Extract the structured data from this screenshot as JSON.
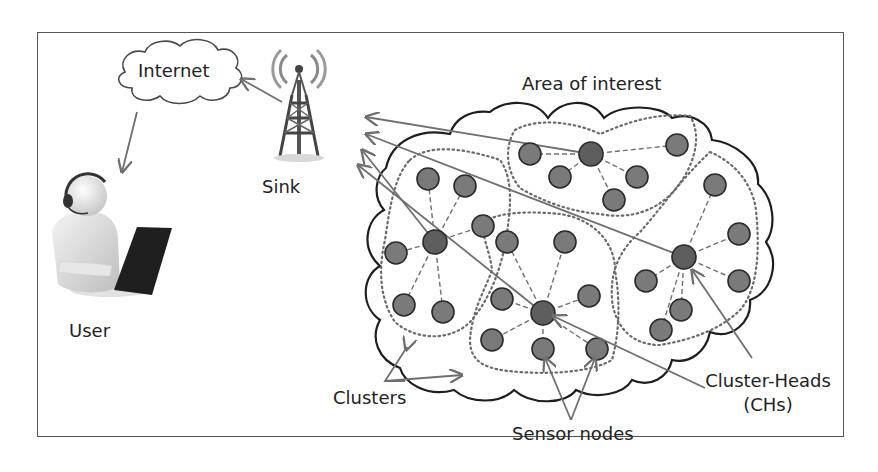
{
  "diagram": {
    "labels": {
      "internet": "Internet",
      "sink": "Sink",
      "user": "User",
      "area": "Area of interest",
      "clusters": "Clusters",
      "sensor_nodes": "Sensor nodes",
      "cluster_heads_line1": "Cluster-Heads",
      "cluster_heads_line2": "(CHs)"
    },
    "colors": {
      "node_fill": "#7a7a7a",
      "ch_fill": "#5e5e5e",
      "node_stroke": "#2a2a2a",
      "arrow": "#6f6f6f",
      "cloud_stroke": "#1e1e1e",
      "cluster_dotted": "#6a6a6a"
    },
    "clusters": [
      {
        "name": "cluster-left",
        "head": [
          435,
          242
        ],
        "members": [
          [
            428,
            179
          ],
          [
            465,
            186
          ],
          [
            483,
            226
          ],
          [
            396,
            253
          ],
          [
            404,
            305
          ],
          [
            443,
            312
          ]
        ]
      },
      {
        "name": "cluster-top",
        "head": [
          591,
          154
        ],
        "members": [
          [
            530,
            154
          ],
          [
            560,
            177
          ],
          [
            637,
            177
          ],
          [
            614,
            200
          ],
          [
            677,
            145
          ]
        ]
      },
      {
        "name": "cluster-center",
        "head": [
          543,
          313
        ],
        "members": [
          [
            507,
            242
          ],
          [
            565,
            242
          ],
          [
            589,
            296
          ],
          [
            502,
            299
          ],
          [
            492,
            340
          ],
          [
            543,
            349
          ],
          [
            597,
            349
          ]
        ]
      },
      {
        "name": "cluster-right",
        "head": [
          684,
          257
        ],
        "members": [
          [
            715,
            185
          ],
          [
            739,
            234
          ],
          [
            739,
            281
          ],
          [
            646,
            281
          ],
          [
            681,
            310
          ],
          [
            661,
            330
          ]
        ]
      }
    ]
  }
}
